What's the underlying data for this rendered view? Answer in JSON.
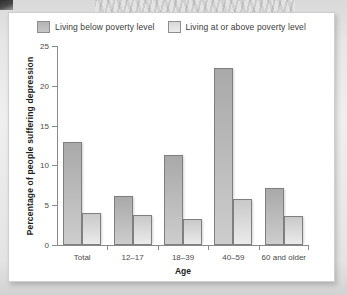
{
  "chart_data": {
    "type": "bar",
    "title": "",
    "xlabel": "Age",
    "ylabel": "Percentage of people suffering depression",
    "categories": [
      "Total",
      "12–17",
      "18–39",
      "40–59",
      "60 and older"
    ],
    "series": [
      {
        "name": "Living below poverty level",
        "color": "#b4b4b4",
        "values": [
          13.0,
          6.2,
          11.3,
          22.3,
          7.2
        ]
      },
      {
        "name": "Living at or above poverty level",
        "color": "#dcdcdc",
        "values": [
          4.0,
          3.8,
          3.3,
          5.8,
          3.6
        ]
      }
    ],
    "ylim": [
      0,
      25
    ],
    "yticks": [
      0,
      5,
      10,
      15,
      20,
      25
    ],
    "ytick_labels": [
      "0",
      "5",
      "10",
      "15",
      "20",
      "25"
    ],
    "grid": false,
    "legend_position": "top-center"
  },
  "legend": {
    "items": [
      {
        "label": "Living below poverty level",
        "swatch": "legend-swatch-below"
      },
      {
        "label": "Living at or above poverty level",
        "swatch": "legend-swatch-above"
      }
    ]
  }
}
